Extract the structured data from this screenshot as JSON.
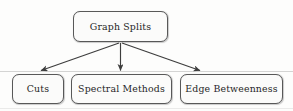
{
  "diagram": {
    "type": "tree",
    "title": "Graph Splits",
    "root": {
      "id": "root",
      "label": "Graph Splits"
    },
    "children": [
      {
        "id": "cuts",
        "label": "Cuts"
      },
      {
        "id": "spectral",
        "label": "Spectral Methods"
      },
      {
        "id": "edge-betweenness",
        "label": "Edge Betweenness"
      }
    ],
    "edges": [
      {
        "from": "Graph Splits",
        "to": "Cuts",
        "style": "arrow"
      },
      {
        "from": "Graph Splits",
        "to": "Spectral Methods",
        "style": "arrow"
      },
      {
        "from": "Graph Splits",
        "to": "Edge Betweenness",
        "style": "arrow"
      }
    ],
    "colors": {
      "box_border": "#585858",
      "box_fill": "#fbfbfa",
      "text": "#262626",
      "arrow": "#3d3d3d",
      "background": "#fdfdfc"
    }
  }
}
